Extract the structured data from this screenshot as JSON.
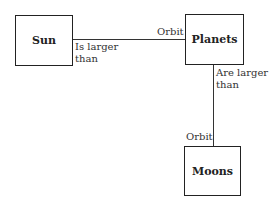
{
  "diagram": {
    "nodes": [
      {
        "id": "sun",
        "label": "Sun"
      },
      {
        "id": "planets",
        "label": "Planets"
      },
      {
        "id": "moons",
        "label": "Moons"
      }
    ],
    "edges": [
      {
        "from": "sun",
        "to": "planets",
        "source_label": "Is larger\nthan",
        "target_label": "Orbit"
      },
      {
        "from": "planets",
        "to": "moons",
        "source_label": "Are larger\nthan",
        "target_label": "Orbit"
      }
    ]
  }
}
